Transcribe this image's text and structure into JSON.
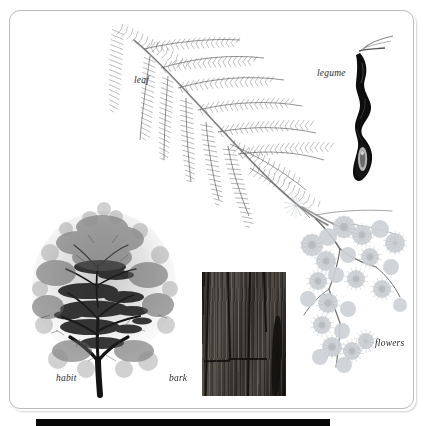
{
  "plate": {
    "kind": "botanical-identification-plate",
    "background_color": "#ffffff",
    "frame_color": "#b9bcbe",
    "bottom_bar_color": "#070707",
    "label_color": "#2b2b2b"
  },
  "labels": {
    "leaf": "leaf",
    "legume": "legume",
    "flowers": "flowers",
    "habit": "habit",
    "bark": "bark"
  },
  "figures": {
    "leaf": {
      "name": "leaf",
      "description": "bipinnate compound frond, feathery pinnae on arching rachis",
      "ink_color": "#5a5a5a"
    },
    "legume": {
      "name": "legume",
      "description": "dark twisted seed pod with constrictions",
      "ink_color": "#111111"
    },
    "flowers": {
      "name": "flowers",
      "description": "pale fluffy puffball flower heads on branching stems",
      "ink_color": "#c9cdd2"
    },
    "habit": {
      "name": "habit",
      "description": "spreading tree crown with dark trunk",
      "ink_color": "#1d1d1d"
    },
    "bark": {
      "name": "bark",
      "description": "photographic panel of fissured grey-brown trunk bark",
      "panel_color": "#3b3733"
    }
  }
}
